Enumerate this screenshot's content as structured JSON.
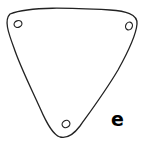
{
  "figure": {
    "label": "e",
    "shape": "rounded-triangle",
    "stroke_color": "#222222",
    "fill_color": "#ffffff",
    "holes": [
      {
        "name": "top-left-hole",
        "cx": 18,
        "cy": 24
      },
      {
        "name": "top-right-hole",
        "cx": 129,
        "cy": 26
      },
      {
        "name": "bottom-hole",
        "cx": 66,
        "cy": 124
      }
    ]
  }
}
